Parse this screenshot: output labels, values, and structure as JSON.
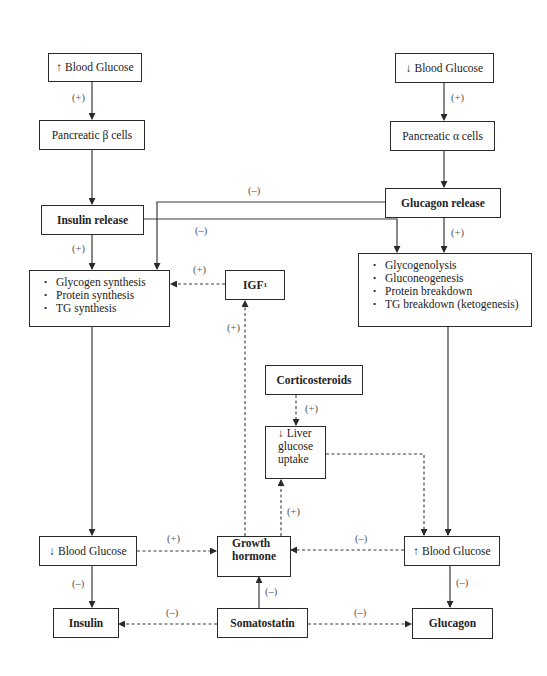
{
  "nodes": {
    "bg_up_top": {
      "arrow": "↑",
      "label": "Blood Glucose"
    },
    "beta_cells": {
      "label": "Pancreatic β cells"
    },
    "insulin_release": {
      "label": "Insulin release"
    },
    "bg_down_top": {
      "arrow": "↓",
      "label": "Blood Glucose"
    },
    "alpha_cells": {
      "label": "Pancreatic α cells"
    },
    "glucagon_release": {
      "label": "Glucagon release"
    },
    "synthesis": {
      "items": [
        "Glycogen synthesis",
        "Protein synthesis",
        "TG synthesis"
      ]
    },
    "igf": {
      "label": "IGF",
      "sup": "1"
    },
    "breakdown": {
      "items": [
        "Glycogenolysis",
        "Gluconeogenesis",
        "Protein breakdown",
        "TG breakdown (ketogenesis)"
      ]
    },
    "corticosteroids": {
      "label": "Corticosteroids"
    },
    "liver": {
      "lines": [
        "↓ Liver",
        "glucose",
        "uptake"
      ]
    },
    "bg_down_bottom": {
      "arrow": "↓",
      "label": "Blood Glucose"
    },
    "growth_hormone": {
      "lines": [
        "Growth",
        "hormone"
      ]
    },
    "bg_up_bottom": {
      "arrow": "↑",
      "label": "Blood Glucose"
    },
    "insulin": {
      "label": "Insulin"
    },
    "somatostatin": {
      "label": "Somatostatin"
    },
    "glucagon": {
      "label": "Glucagon"
    }
  },
  "edge_labels": {
    "bgup_beta": "(+)",
    "bgdown_alpha": "(+)",
    "glucagon_to_synthesis": "(–)",
    "insulin_to_breakdown": "(–)",
    "insulin_to_synthesis": "(+)",
    "igf_to_synthesis": "(+)",
    "glucagon_to_breakdown": "(+)",
    "gh_to_igf": "(+)",
    "cortico_to_liver": "(+)",
    "gh_to_liver": "(+)",
    "bgdown_to_gh": "(+)",
    "bgup_to_gh": "(–)",
    "bgdown_to_insulin": "(–)",
    "somato_to_gh": "(–)",
    "bgup_to_glucagon": "(–)",
    "somato_to_insulin": "(–)",
    "somato_to_glucagon": "(–)"
  },
  "colors": {
    "line": "#3a3a3a",
    "border": "#2a2a2a",
    "label": "#555555"
  }
}
